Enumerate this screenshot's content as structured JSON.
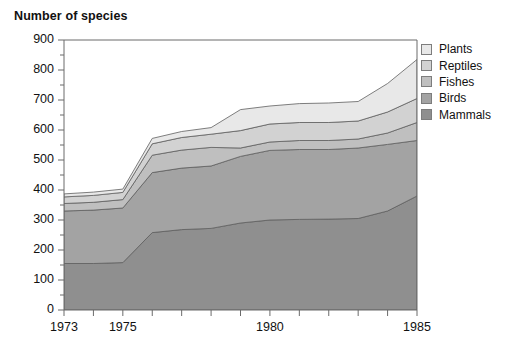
{
  "chart_data": {
    "type": "area",
    "stacked": true,
    "title": "Number of species",
    "xlabel": "",
    "ylabel": "",
    "ylim": [
      0,
      900
    ],
    "ytick_step": 100,
    "xlim": [
      1973,
      1985
    ],
    "grid": false,
    "legend_position": "right",
    "x": [
      1973,
      1974,
      1975,
      1976,
      1977,
      1978,
      1979,
      1980,
      1981,
      1982,
      1983,
      1984,
      1985
    ],
    "y_ticks": [
      "0",
      "100",
      "200",
      "300",
      "400",
      "500",
      "600",
      "700",
      "800",
      "900"
    ],
    "x_ticks": [
      "1973",
      "1974",
      "1975",
      "1976",
      "1977",
      "1978",
      "1979",
      "1980",
      "1981",
      "1982",
      "1983",
      "1984",
      "1985"
    ],
    "x_ticks_labeled": [
      "1973",
      "1975",
      "1980",
      "1985"
    ],
    "series": [
      {
        "name": "Mammals",
        "color": "#8f8f8f",
        "values": [
          155,
          155,
          158,
          258,
          268,
          272,
          290,
          300,
          302,
          303,
          305,
          330,
          380
        ]
      },
      {
        "name": "Birds",
        "color": "#a3a3a3",
        "values": [
          175,
          178,
          182,
          200,
          205,
          208,
          222,
          232,
          233,
          232,
          235,
          222,
          185
        ]
      },
      {
        "name": "Fishes",
        "color": "#bfbfbf",
        "values": [
          25,
          26,
          28,
          58,
          60,
          62,
          28,
          28,
          30,
          30,
          30,
          38,
          60
        ]
      },
      {
        "name": "Reptiles",
        "color": "#d2d2d2",
        "values": [
          22,
          23,
          24,
          38,
          42,
          44,
          58,
          60,
          60,
          60,
          60,
          70,
          80
        ]
      },
      {
        "name": "Plants",
        "color": "#e8e8e8",
        "values": [
          10,
          11,
          11,
          18,
          20,
          22,
          70,
          60,
          63,
          65,
          65,
          95,
          130
        ]
      }
    ],
    "cumulative_totals": [
      387,
      393,
      403,
      572,
      595,
      608,
      668,
      680,
      688,
      690,
      695,
      755,
      835
    ],
    "legend": [
      {
        "label": "Plants",
        "color": "#e8e8e8"
      },
      {
        "label": "Reptiles",
        "color": "#d2d2d2"
      },
      {
        "label": "Fishes",
        "color": "#bfbfbf"
      },
      {
        "label": "Birds",
        "color": "#a3a3a3"
      },
      {
        "label": "Mammals",
        "color": "#8f8f8f"
      }
    ]
  },
  "axis_color": "#6b6b6b",
  "line_color": "#5f5f5f"
}
